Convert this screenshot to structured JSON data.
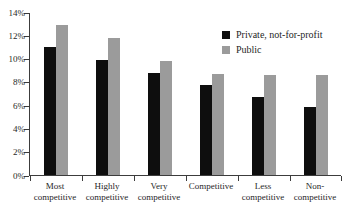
{
  "chart_data": {
    "type": "bar",
    "title": "",
    "xlabel": "",
    "ylabel": "",
    "categories": [
      "Most\ncompetitive",
      "Highly\ncompetitive",
      "Very\ncompetitive",
      "Competitive",
      "Less\ncompetitive",
      "Non-\ncompetitive"
    ],
    "series": [
      {
        "name": "Private, not-for-profit",
        "color": "#0e0e0e",
        "values": [
          11.0,
          9.9,
          8.8,
          7.7,
          6.7,
          5.8
        ]
      },
      {
        "name": "Public",
        "color": "#9b9b9b",
        "values": [
          12.9,
          11.8,
          9.8,
          8.7,
          8.6,
          8.6
        ]
      }
    ],
    "ylim": [
      0,
      14
    ],
    "ytick_step": 2,
    "ytick_labels": [
      "0%",
      "2%",
      "4%",
      "6%",
      "8%",
      "10%",
      "12%",
      "14%"
    ],
    "grid": false,
    "legend_position": "top-right-inside",
    "axis_color": "#3c3c3c",
    "background_color": "#ffffff"
  }
}
